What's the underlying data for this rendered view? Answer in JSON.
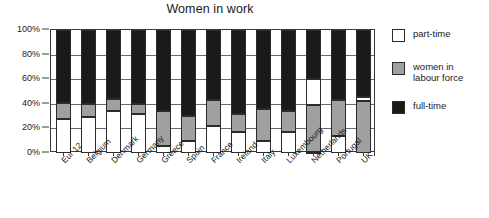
{
  "chart_data": {
    "type": "bar",
    "subtype": "stacked-100-percent",
    "title": "Women in work",
    "xlabel": "",
    "ylabel": "",
    "ylim": [
      0,
      100
    ],
    "ytick_labels": [
      "0%",
      "20%",
      "40%",
      "60%",
      "80%",
      "100%"
    ],
    "ytick_values": [
      0,
      20,
      40,
      60,
      80,
      100
    ],
    "grid": true,
    "legend_position": "right",
    "categories": [
      "Eur 12",
      "Belgium",
      "Denmark",
      "Germany",
      "Greece",
      "Spain",
      "France",
      "Ireland",
      "Italy",
      "Luxembourg",
      "Netherlands",
      "Portugal",
      "UK"
    ],
    "series": [
      {
        "name": "part-time",
        "color": "#ffffff",
        "values": [
          28,
          29,
          34.5,
          32,
          6,
          9.5,
          22,
          17,
          10,
          17,
          22,
          14,
          3.5
        ]
      },
      {
        "name": "women in labour force",
        "color": "#a0a0a0",
        "values": [
          13,
          11,
          9,
          8,
          28,
          20.5,
          21,
          15,
          26,
          17,
          38,
          29,
          42
        ]
      },
      {
        "name": "full-time",
        "color": "#1a1a1a",
        "values": [
          59,
          60,
          56.5,
          60,
          66,
          70,
          57,
          68,
          64,
          66,
          40,
          57,
          54.5
        ]
      }
    ],
    "bars": [
      {
        "category": "Eur 12",
        "segments": [
          {
            "series": "part-time",
            "from": 0,
            "to": 28
          },
          {
            "series": "women in labour force",
            "from": 28,
            "to": 41
          },
          {
            "series": "full-time",
            "from": 41,
            "to": 100
          }
        ]
      },
      {
        "category": "Belgium",
        "segments": [
          {
            "series": "part-time",
            "from": 0,
            "to": 29
          },
          {
            "series": "women in labour force",
            "from": 29,
            "to": 40
          },
          {
            "series": "full-time",
            "from": 40,
            "to": 100
          }
        ]
      },
      {
        "category": "Denmark",
        "segments": [
          {
            "series": "part-time",
            "from": 0,
            "to": 34.5
          },
          {
            "series": "women in labour force",
            "from": 34.5,
            "to": 43.5
          },
          {
            "series": "full-time",
            "from": 43.5,
            "to": 100
          }
        ]
      },
      {
        "category": "Germany",
        "segments": [
          {
            "series": "part-time",
            "from": 0,
            "to": 32
          },
          {
            "series": "women in labour force",
            "from": 32,
            "to": 40
          },
          {
            "series": "full-time",
            "from": 40,
            "to": 100
          }
        ]
      },
      {
        "category": "Greece",
        "segments": [
          {
            "series": "part-time",
            "from": 0,
            "to": 6
          },
          {
            "series": "women in labour force",
            "from": 6,
            "to": 34
          },
          {
            "series": "full-time",
            "from": 34,
            "to": 100
          }
        ]
      },
      {
        "category": "Spain",
        "segments": [
          {
            "series": "part-time",
            "from": 0,
            "to": 9.5
          },
          {
            "series": "women in labour force",
            "from": 9.5,
            "to": 30
          },
          {
            "series": "full-time",
            "from": 30,
            "to": 100
          }
        ]
      },
      {
        "category": "France",
        "segments": [
          {
            "series": "part-time",
            "from": 0,
            "to": 22
          },
          {
            "series": "women in labour force",
            "from": 22,
            "to": 43
          },
          {
            "series": "full-time",
            "from": 43,
            "to": 100
          }
        ]
      },
      {
        "category": "Ireland",
        "segments": [
          {
            "series": "part-time",
            "from": 0,
            "to": 17
          },
          {
            "series": "women in labour force",
            "from": 17,
            "to": 32
          },
          {
            "series": "full-time",
            "from": 32,
            "to": 100
          }
        ]
      },
      {
        "category": "Italy",
        "segments": [
          {
            "series": "part-time",
            "from": 0,
            "to": 10
          },
          {
            "series": "women in labour force",
            "from": 10,
            "to": 36
          },
          {
            "series": "full-time",
            "from": 36,
            "to": 100
          }
        ]
      },
      {
        "category": "Luxembourg",
        "segments": [
          {
            "series": "part-time",
            "from": 0,
            "to": 17
          },
          {
            "series": "women in labour force",
            "from": 17,
            "to": 34
          },
          {
            "series": "full-time",
            "from": 34,
            "to": 100
          }
        ]
      },
      {
        "category": "Netherlands",
        "segments": [
          {
            "series": "part-time",
            "from": 0,
            "to": 1
          },
          {
            "series": "women in labour force",
            "from": 1,
            "to": 39
          },
          {
            "series": "part-time",
            "from": 39,
            "to": 60
          },
          {
            "series": "full-time",
            "from": 60,
            "to": 100
          }
        ]
      },
      {
        "category": "Portugal",
        "segments": [
          {
            "series": "part-time",
            "from": 0,
            "to": 14
          },
          {
            "series": "women in labour force",
            "from": 14,
            "to": 43
          },
          {
            "series": "full-time",
            "from": 43,
            "to": 100
          }
        ]
      },
      {
        "category": "UK",
        "segments": [
          {
            "series": "women in labour force",
            "from": 0,
            "to": 42
          },
          {
            "series": "part-time",
            "from": 42,
            "to": 45.5
          },
          {
            "series": "full-time",
            "from": 45.5,
            "to": 100
          }
        ]
      }
    ]
  },
  "legend": {
    "items": [
      {
        "label": "part-time",
        "color": "#ffffff",
        "swatch_class": "sw-part"
      },
      {
        "label": "women in\nlabour force",
        "color": "#a0a0a0",
        "swatch_class": "sw-labour"
      },
      {
        "label": "full-time",
        "color": "#1a1a1a",
        "swatch_class": "sw-full"
      }
    ]
  },
  "colors": {
    "part_time": "#ffffff",
    "labour_force": "#a0a0a0",
    "full_time": "#1a1a1a",
    "axis": "#3a3a3a",
    "grid": "#6a6a6a",
    "text": "#1a1a1a",
    "background": "#ffffff"
  }
}
